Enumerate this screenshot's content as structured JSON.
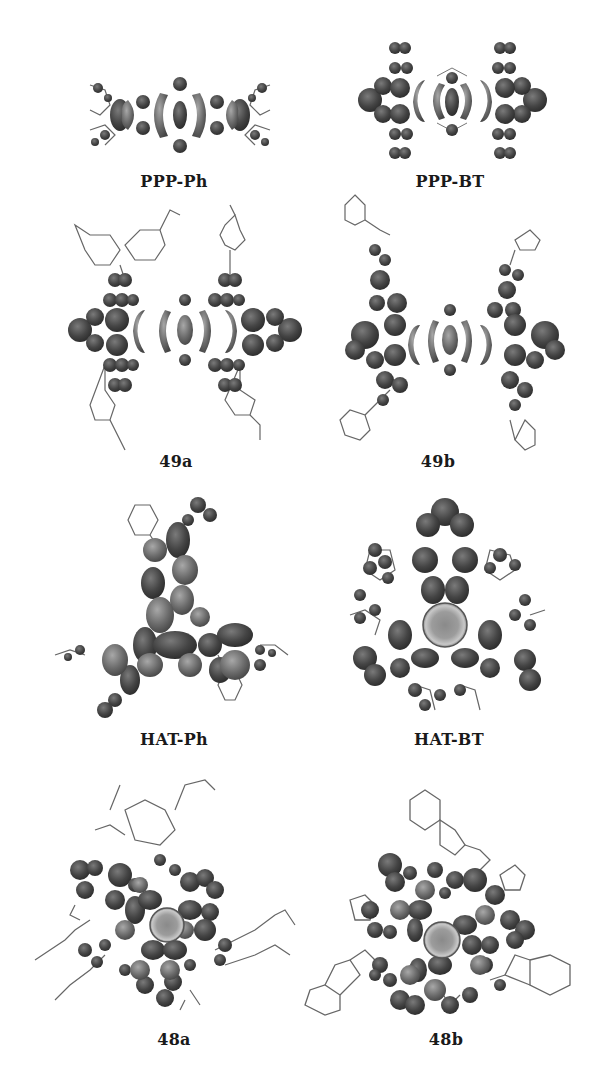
{
  "figure": {
    "panels": [
      {
        "id": "ppp-ph",
        "label": "PPP-Ph",
        "row": 1,
        "col": 1
      },
      {
        "id": "ppp-bt",
        "label": "PPP-BT",
        "row": 1,
        "col": 2
      },
      {
        "id": "49a",
        "label": "49a",
        "row": 2,
        "col": 1
      },
      {
        "id": "49b",
        "label": "49b",
        "row": 2,
        "col": 2
      },
      {
        "id": "hat-ph",
        "label": "HAT-Ph",
        "row": 3,
        "col": 1
      },
      {
        "id": "hat-bt",
        "label": "HAT-BT",
        "row": 3,
        "col": 2
      },
      {
        "id": "48a",
        "label": "48a",
        "row": 4,
        "col": 1
      },
      {
        "id": "48b",
        "label": "48b",
        "row": 4,
        "col": 2
      }
    ]
  },
  "colors": {
    "lobe_dark": "#3a3a3a",
    "lobe_mid": "#6a6a6a",
    "lobe_light": "#9a9a9a",
    "bond": "#555555",
    "label": "#1a1a1a"
  }
}
